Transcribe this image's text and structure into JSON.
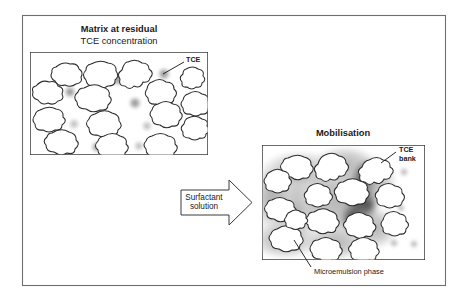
{
  "figure": {
    "background_color": "#ffffff",
    "frame_color": "#6f6f6f",
    "grain_outline_color": "#2b2b2b",
    "tce_droplet_color": "#8c8c8c",
    "microemulsion_color": "#b9b9b9",
    "tce_bank_color": "#3d3d3d"
  },
  "left_panel": {
    "title_line1": "Matrix at residual",
    "title_line2": "TCE concentration",
    "callout_label": "TCE"
  },
  "arrow": {
    "label_line1": "Surfactant",
    "label_line2": "solution"
  },
  "right_panel": {
    "title": "Mobilisation",
    "callout_label_line1": "TCE",
    "callout_label_line2": "bank",
    "caption": "Microemulsion phase"
  }
}
